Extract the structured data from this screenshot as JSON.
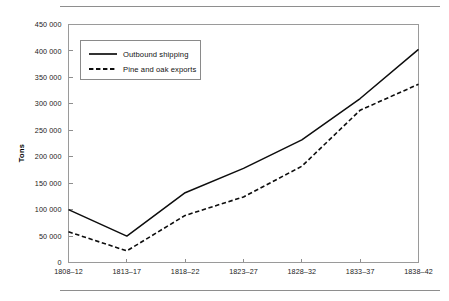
{
  "figure": {
    "caption_fragment": "",
    "axis_title_y": "Tons"
  },
  "chart_data": {
    "type": "line",
    "title": "",
    "subtitle": "",
    "xlabel": "",
    "ylabel": "Tons",
    "categories": [
      "1808–12",
      "1813–17",
      "1818–22",
      "1823–27",
      "1828–32",
      "1833–37",
      "1838–42"
    ],
    "ylim": [
      0,
      450000
    ],
    "ytick_values": [
      0,
      50000,
      100000,
      150000,
      200000,
      250000,
      300000,
      350000,
      400000,
      450000
    ],
    "ytick_labels": [
      "0",
      "50 000",
      "100 000",
      "150 000",
      "200 000",
      "250 000",
      "300 000",
      "350 000",
      "400 000",
      "450 000"
    ],
    "grid": false,
    "legend_position": "upper-left",
    "series": [
      {
        "name": "Outbound shipping",
        "style": "solid",
        "color": "#0d0d0d",
        "values": [
          100000,
          50000,
          132000,
          178000,
          232000,
          310000,
          403000
        ]
      },
      {
        "name": "Pine and oak exports",
        "style": "dashed",
        "color": "#0d0d0d",
        "values": [
          58000,
          22000,
          89000,
          124000,
          182000,
          288000,
          337000
        ]
      }
    ]
  }
}
